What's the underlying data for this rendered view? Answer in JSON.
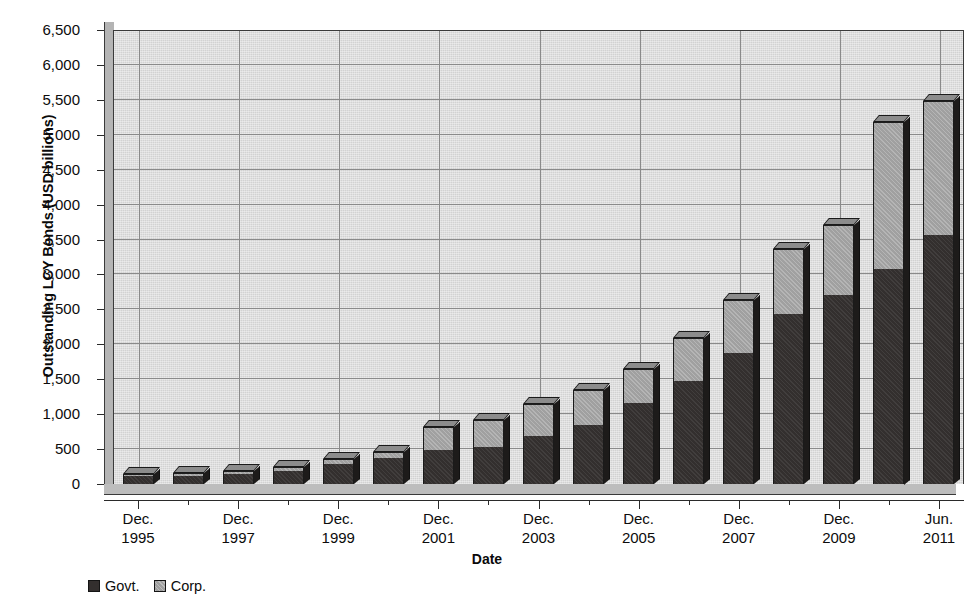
{
  "chart_data": {
    "type": "bar",
    "subtype": "stacked-bar-3d",
    "title": "",
    "xlabel": "Date",
    "ylabel": "Outstanding LCY Bonds (USD billions)",
    "ylim": [
      0,
      6500
    ],
    "ytick_step": 500,
    "ytick_labels": [
      "0",
      "500",
      "1,000",
      "1,500",
      "2,000",
      "2,500",
      "3,000",
      "3,500",
      "4,000",
      "4,500",
      "5,000",
      "5,500",
      "6,000",
      "6,500"
    ],
    "ytick_values": [
      0,
      500,
      1000,
      1500,
      2000,
      2500,
      3000,
      3500,
      4000,
      4500,
      5000,
      5500,
      6000,
      6500
    ],
    "grid": true,
    "legend_position": "bottom-left",
    "legend": [
      "Govt.",
      "Corp."
    ],
    "xtick_labels": [
      {
        "line1": "Dec.",
        "line2": "1995"
      },
      {
        "line1": "Dec.",
        "line2": "1997"
      },
      {
        "line1": "Dec.",
        "line2": "1999"
      },
      {
        "line1": "Dec.",
        "line2": "2001"
      },
      {
        "line1": "Dec.",
        "line2": "2003"
      },
      {
        "line1": "Dec.",
        "line2": "2005"
      },
      {
        "line1": "Dec.",
        "line2": "2007"
      },
      {
        "line1": "Dec.",
        "line2": "2009"
      },
      {
        "line1": "Jun.",
        "line2": "2011"
      }
    ],
    "categories": [
      "Dec. 1995",
      "Dec. 1996",
      "Dec. 1997",
      "Dec. 1998",
      "Dec. 1999",
      "Dec. 2000",
      "Dec. 2001",
      "Dec. 2002",
      "Dec. 2003",
      "Dec. 2004",
      "Dec. 2005",
      "Dec. 2006",
      "Dec. 2007",
      "Dec. 2008",
      "Dec. 2009",
      "Dec. 2010",
      "Jun. 2011"
    ],
    "series": [
      {
        "name": "Govt.",
        "color": "#332f2e",
        "values": [
          110,
          120,
          140,
          190,
          280,
          370,
          480,
          530,
          690,
          840,
          1160,
          1470,
          1880,
          2430,
          2710,
          3080,
          3560
        ]
      },
      {
        "name": "Corp.",
        "color": "#a0a0a0",
        "values": [
          35,
          35,
          45,
          60,
          80,
          95,
          330,
          380,
          460,
          500,
          490,
          620,
          760,
          930,
          1000,
          2110,
          1930
        ]
      }
    ],
    "totals": [
      145,
      155,
      185,
      250,
      360,
      465,
      810,
      910,
      1150,
      1340,
      1650,
      2090,
      2640,
      3360,
      3710,
      5190,
      5490
    ]
  }
}
